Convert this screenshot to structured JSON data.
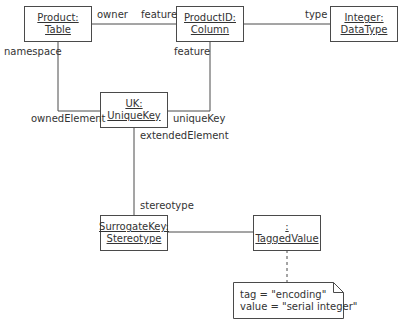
{
  "diagram": {
    "type": "UML object diagram",
    "objects": [
      {
        "id": "product",
        "name": "Product:",
        "type": "Table"
      },
      {
        "id": "productid",
        "name": "ProductID:",
        "type": "Column"
      },
      {
        "id": "integer",
        "name": "Integer:",
        "type": "DataType"
      },
      {
        "id": "uk",
        "name": "UK:",
        "type": "UniqueKey"
      },
      {
        "id": "surrogate",
        "name": "SurrogateKey:",
        "type": "Stereotype"
      },
      {
        "id": "tagged",
        "name": ":",
        "type": "TaggedValue"
      }
    ],
    "labels": {
      "owner": "owner",
      "feature_top": "feature",
      "type": "type",
      "namespace": "namespace",
      "feature_right": "feature",
      "ownedElement": "ownedElement",
      "uniqueKey": "uniqueKey",
      "extendedElement": "extendedElement",
      "stereotype": "stereotype"
    },
    "note": {
      "line1": "tag = \"encoding\"",
      "line2": "value = \"serial integer\""
    },
    "colors": {
      "line": "#4a4a4a",
      "text": "#333333",
      "background": "#ffffff"
    }
  }
}
